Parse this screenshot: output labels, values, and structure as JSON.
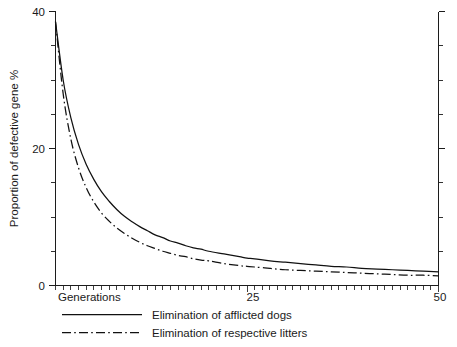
{
  "chart_data": {
    "type": "line",
    "title": "",
    "xlabel": "Generations",
    "ylabel": "Proportion of defective gene %",
    "xlim": [
      0,
      50
    ],
    "ylim": [
      0,
      40
    ],
    "grid": false,
    "legend_position": "below-plot-left",
    "x_tick_labels": [
      "25",
      "50"
    ],
    "x_tick_values": [
      25,
      50
    ],
    "x_minor_tick_interval": 1,
    "y_tick_labels": [
      "0",
      "20",
      "40"
    ],
    "y_tick_values": [
      0,
      20,
      40
    ],
    "y_minor_tick_interval": 5,
    "x": [
      0,
      1,
      2,
      3,
      4,
      5,
      6,
      7,
      8,
      9,
      10,
      11,
      12,
      13,
      14,
      15,
      16,
      17,
      18,
      19,
      20,
      22,
      24,
      25,
      26,
      28,
      30,
      32,
      34,
      36,
      38,
      40,
      42,
      44,
      46,
      48,
      50
    ],
    "series": [
      {
        "name": "Elimination of afflicted dogs",
        "style": "solid",
        "values": [
          38.5,
          30.0,
          24.5,
          20.6,
          17.7,
          15.5,
          13.7,
          12.3,
          11.1,
          10.1,
          9.3,
          8.6,
          8.0,
          7.4,
          7.0,
          6.5,
          6.2,
          5.8,
          5.5,
          5.3,
          5.0,
          4.6,
          4.2,
          4.0,
          3.9,
          3.6,
          3.4,
          3.2,
          3.0,
          2.8,
          2.7,
          2.5,
          2.4,
          2.3,
          2.2,
          2.1,
          2.0
        ]
      },
      {
        "name": "Elimination of respective litters",
        "style": "dash-dot",
        "values": [
          38.5,
          28.0,
          21.4,
          17.2,
          14.3,
          12.2,
          10.6,
          9.4,
          8.4,
          7.6,
          6.9,
          6.3,
          5.8,
          5.4,
          5.0,
          4.7,
          4.4,
          4.2,
          3.9,
          3.7,
          3.6,
          3.2,
          2.9,
          2.8,
          2.7,
          2.5,
          2.3,
          2.2,
          2.1,
          2.0,
          1.9,
          1.8,
          1.7,
          1.6,
          1.5,
          1.5,
          1.4
        ]
      }
    ],
    "colors": {
      "series_line": "#111111",
      "axis": "#1c1c1c",
      "background": "#ffffff"
    }
  },
  "legend": {
    "entries": [
      {
        "label": "Elimination of afflicted dogs",
        "style": "solid"
      },
      {
        "label": "Elimination of respective litters",
        "style": "dash-dot"
      }
    ]
  },
  "axes": {
    "y_label_top": "40",
    "y_label_mid": "20",
    "y_label_bottom": "0",
    "x_label_origin": "Generations",
    "x_label_mid": "25",
    "x_label_end": "50",
    "y_axis_title": "Proportion of defective gene %"
  }
}
